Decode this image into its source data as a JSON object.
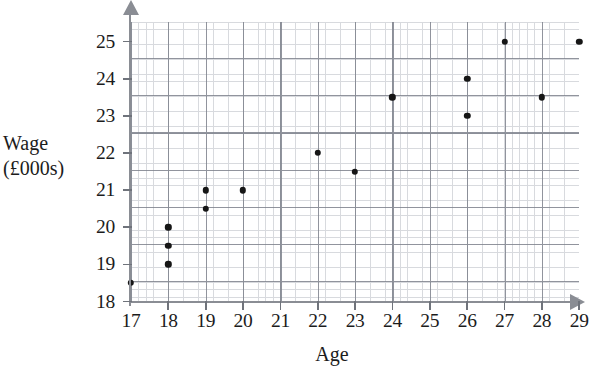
{
  "chart_data": {
    "type": "scatter",
    "title": "",
    "xlabel": "Age",
    "ylabel_lines": [
      "Wage",
      "(£000s)"
    ],
    "xlim": [
      17,
      29
    ],
    "ylim": [
      18,
      25.4
    ],
    "xticks": [
      17,
      18,
      19,
      20,
      21,
      22,
      23,
      24,
      25,
      26,
      27,
      28,
      29
    ],
    "yticks": [
      18,
      19,
      20,
      21,
      22,
      23,
      24,
      25
    ],
    "xtick_labels": [
      "17",
      "18",
      "19",
      "20",
      "21",
      "22",
      "23",
      "24",
      "25",
      "26",
      "27",
      "28",
      "29"
    ],
    "ytick_labels": [
      "18",
      "19",
      "20",
      "21",
      "22",
      "23",
      "24",
      "25"
    ],
    "grid": true,
    "grid_major_step_x": 1,
    "grid_major_step_y": 1,
    "grid_minor_per_major": 5,
    "legend": null,
    "point_color": "#161616",
    "grid_major_color": "#7e828c",
    "grid_minor_color": "#b9bcc4",
    "axis_color": "#8a8d94",
    "points": [
      {
        "x": 17,
        "y": 18.5
      },
      {
        "x": 18,
        "y": 19
      },
      {
        "x": 18,
        "y": 19.5
      },
      {
        "x": 18,
        "y": 20
      },
      {
        "x": 19,
        "y": 20.5
      },
      {
        "x": 19,
        "y": 21
      },
      {
        "x": 20,
        "y": 21
      },
      {
        "x": 22,
        "y": 22
      },
      {
        "x": 23,
        "y": 21.5
      },
      {
        "x": 24,
        "y": 23.5
      },
      {
        "x": 26,
        "y": 23
      },
      {
        "x": 26,
        "y": 24
      },
      {
        "x": 27,
        "y": 25
      },
      {
        "x": 28,
        "y": 23.5
      },
      {
        "x": 29,
        "y": 25
      }
    ]
  }
}
